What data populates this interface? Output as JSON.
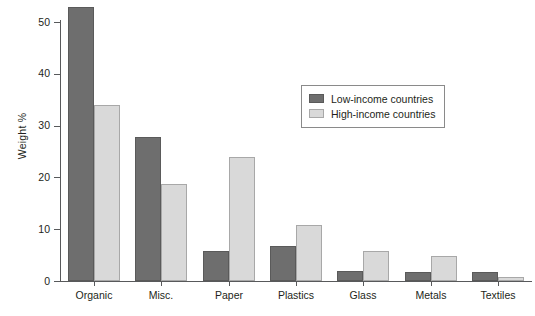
{
  "chart_data": {
    "type": "bar",
    "title": "",
    "xlabel": "",
    "ylabel": "Weight %",
    "ylim": [
      0,
      55
    ],
    "yticks": [
      0,
      10,
      20,
      30,
      40,
      50
    ],
    "ytick_labels": [
      "0",
      "10",
      "20",
      "30",
      "40",
      "50"
    ],
    "grid": false,
    "legend_position": "upper-center-right",
    "categories": [
      "Organic",
      "Misc.",
      "Paper",
      "Plastics",
      "Glass",
      "Metals",
      "Textiles"
    ],
    "series": [
      {
        "name": "Low-income countries",
        "color": "#6e6e6e",
        "values": [
          52.8,
          27.8,
          5.8,
          6.7,
          1.9,
          1.8,
          1.8
        ]
      },
      {
        "name": "High-income countries",
        "color": "#d9d9d9",
        "values": [
          34.0,
          18.8,
          24.0,
          10.8,
          5.8,
          4.8,
          0.7
        ]
      }
    ]
  },
  "axis": {
    "y_label": "Weight %",
    "axis_color": "#58595b"
  },
  "legend": {
    "entries": [
      {
        "label": "Low-income countries",
        "swatch": "low"
      },
      {
        "label": "High-income countries",
        "swatch": "high"
      }
    ]
  }
}
